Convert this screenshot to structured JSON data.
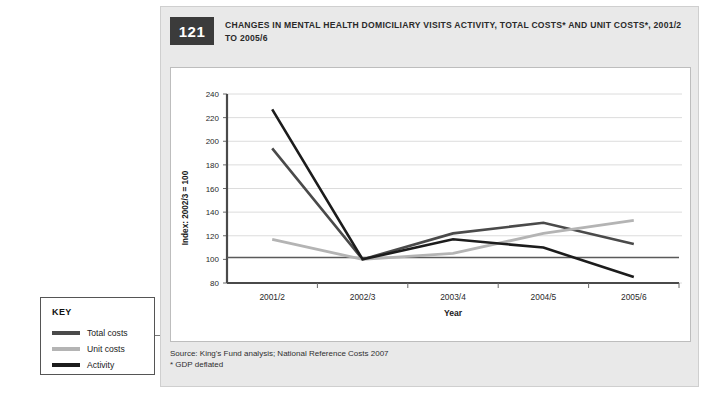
{
  "figure": {
    "number": "121",
    "title": "CHANGES IN MENTAL HEALTH DOMICILIARY VISITS ACTIVITY, TOTAL COSTS* AND UNIT COSTS*, 2001/2 TO 2005/6",
    "source_line_1": "Source: King's Fund analysis; National Reference Costs 2007",
    "source_line_2": "* GDP deflated"
  },
  "key": {
    "title": "KEY",
    "items": [
      {
        "label": "Total costs",
        "color": "#4a4a4a"
      },
      {
        "label": "Unit costs",
        "color": "#b4b4b4"
      },
      {
        "label": "Activity",
        "color": "#1c1c1c"
      }
    ]
  },
  "chart_data": {
    "type": "line",
    "title": "CHANGES IN MENTAL HEALTH DOMICILIARY VISITS ACTIVITY, TOTAL COSTS* AND UNIT COSTS*, 2001/2 TO 2005/6",
    "xlabel": "Year",
    "ylabel": "Index: 2002/3 = 100",
    "categories": [
      "2001/2",
      "2002/3",
      "2003/4",
      "2004/5",
      "2005/6"
    ],
    "ylim": [
      80,
      240
    ],
    "yticks": [
      80,
      100,
      120,
      140,
      160,
      180,
      200,
      220,
      240
    ],
    "ytick_labels": [
      "80",
      "100",
      "120",
      "140",
      "160",
      "180",
      "200",
      "220",
      "240"
    ],
    "grid": true,
    "grid_axis": "y",
    "baseline": 100,
    "legend_position": "external-left",
    "series": [
      {
        "name": "Total costs",
        "color": "#4a4a4a",
        "values": [
          194,
          100,
          122,
          131,
          113
        ]
      },
      {
        "name": "Unit costs",
        "color": "#b4b4b4",
        "values": [
          117,
          100,
          105,
          122,
          133
        ]
      },
      {
        "name": "Activity",
        "color": "#1c1c1c",
        "values": [
          227,
          100,
          117,
          110,
          85
        ]
      }
    ]
  }
}
